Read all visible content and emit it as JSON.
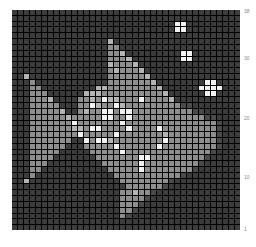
{
  "chart_data": {
    "type": "heatmap",
    "title": "",
    "xlabel": "",
    "ylabel": "",
    "rows": 38,
    "cols": 38,
    "y_ticks": [
      "38",
      "30",
      "20",
      "10",
      "1"
    ],
    "palette": {
      "0": "#3c3c3c",
      "1": "#4a4a4a",
      "2": "#8e8e8e",
      "3": "#b4b4b4",
      "4": "#f2f2f2"
    },
    "grid": [
      "00000000000000000000000000000000000000",
      "00000000000000000000000000000000000000",
      "00000000000000000000000000044000000000",
      "00000000000000000000000000044000000000",
      "00000000000000000000000000000000000000",
      "00000000000000003000000000000000000000",
      "00000000000000002200000000000000000000",
      "00000000000000002230000000004400000000",
      "00000000000000002223000000004400000000",
      "00000000000000003222300000000000000000",
      "00000000000000002322230000000000000000",
      "00300000000000002222223000000000000000",
      "00020000000000002222222300000000440000",
      "00022000000000332222222230000004444000",
      "00022200000033322222222223000000440000",
      "00022230000223243322242222300000000000",
      "00022222000224322432222222221100000000",
      "00022222300232244244222222222211000000",
      "00022222232222244224222222222222110000",
      "00022222224222222242222222222222221000",
      "00022222223324422224222242222222221000",
      "00022222222422222422222223222222221000",
      "00022222220042443222222224222222221000",
      "00022222200022222422222242222222221000",
      "00022222000002222242222222222222210000",
      "00022220000000222222244222222222100000",
      "00022200000000022222242222222221000000",
      "00022000000000002222242222222210000000",
      "00020000000000000222222222221000000000",
      "00300000000000000022222222100000000000",
      "00000000000000000002222221000000000000",
      "00000000000000000022322100000000000000",
      "00000000000000000022221000000000000000",
      "00000000000000000022210000000000000000",
      "00000000000000000022100000000000000000",
      "00000000000000000021000000000000000000",
      "00000000000000000000000000000000000000",
      "00000000000000000000000000000000000000"
    ]
  },
  "labels": {
    "y38": "38",
    "y30": "30",
    "y20": "20",
    "y10": "10",
    "y1": "1"
  }
}
